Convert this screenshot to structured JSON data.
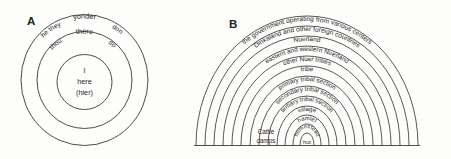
{
  "figure": {
    "panels": [
      {
        "id": "A",
        "label": "A",
        "type": "concentric-circles",
        "rings": [
          {
            "index": 0,
            "name": "outer-ring",
            "labels": [
              "he they",
              "yonder",
              "don"
            ]
          },
          {
            "index": 1,
            "name": "middle-ring",
            "labels": [
              "thou",
              "there",
              "do"
            ]
          },
          {
            "index": 2,
            "name": "inner-ring",
            "labels": [
              "I",
              "here",
              "(hier)"
            ]
          }
        ],
        "text": {
          "he_they": "he they",
          "yonder": "yonder",
          "don": "don",
          "thou": "thou",
          "there": "there",
          "do": "do",
          "i": "I",
          "here": "here",
          "hier": "(hier)"
        }
      },
      {
        "id": "B",
        "label": "B",
        "type": "nested-semicircles",
        "arcs": [
          {
            "index": 0,
            "label": "the government operating from various centers"
          },
          {
            "index": 1,
            "label": "Dinkaland and other foreign countries"
          },
          {
            "index": 2,
            "label": "Nuerland"
          },
          {
            "index": 3,
            "label": "eastern and western Nuerland"
          },
          {
            "index": 4,
            "label": "other Nuer tribes"
          },
          {
            "index": 5,
            "label": "tribe"
          },
          {
            "index": 6,
            "label": "primary tribal section"
          },
          {
            "index": 7,
            "label": "secondary tribal section"
          },
          {
            "index": 8,
            "label": "tertiary tribal section"
          },
          {
            "index": 9,
            "label": "village"
          },
          {
            "index": 10,
            "label": "hamlet"
          },
          {
            "index": 11,
            "label": "homestead"
          },
          {
            "index": 12,
            "label": "hut"
          }
        ],
        "side_labels": [
          {
            "name": "cattle-camps",
            "line1": "Cattle",
            "line2": "camps"
          }
        ]
      }
    ],
    "colors": {
      "ink": "#3a3a3a",
      "text": "#1f1f1f",
      "paper": "#fdfdfb"
    }
  }
}
